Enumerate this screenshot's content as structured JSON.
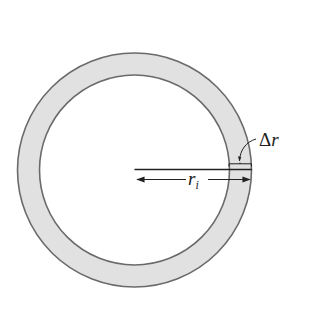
{
  "figure": {
    "type": "annular ring cross-section",
    "colors": {
      "background": "#ffffff",
      "ring_fill": "#e1e1e1",
      "ring_stroke": "#6a6a6a",
      "line": "#222222"
    },
    "geometry": {
      "center_x": 134.5,
      "center_y": 170,
      "outer_radius": 117,
      "inner_radius": 95
    },
    "labels": {
      "inner_radius": {
        "symbol": "r",
        "subscript": "i"
      },
      "thickness": {
        "prefix": "Δ",
        "symbol": "r"
      }
    }
  }
}
